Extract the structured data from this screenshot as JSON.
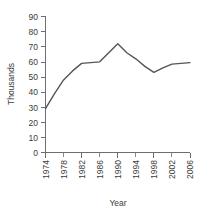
{
  "chart_data": {
    "type": "line",
    "title": "",
    "xlabel": "Year",
    "ylabel": "Thousands",
    "x": [
      1974,
      1976,
      1978,
      1980,
      1982,
      1984,
      1986,
      1988,
      1990,
      1992,
      1994,
      1996,
      1998,
      2000,
      2002,
      2004,
      2006
    ],
    "values": [
      29,
      39,
      48,
      54,
      59,
      59.5,
      60,
      66,
      72,
      66,
      62,
      57,
      53,
      56,
      58.5,
      59,
      59.5
    ],
    "series": [
      {
        "name": "Thousands",
        "color": "#55555a",
        "values": [
          29,
          39,
          48,
          54,
          59,
          59.5,
          60,
          66,
          72,
          66,
          62,
          57,
          53,
          56,
          58.5,
          59,
          59.5
        ]
      }
    ],
    "xlim": [
      1974,
      2006
    ],
    "ylim": [
      0,
      90
    ],
    "ytick_labels": [
      "0",
      "10",
      "20",
      "30",
      "40",
      "50",
      "60",
      "70",
      "80",
      "90"
    ],
    "ytick_values": [
      0,
      10,
      20,
      30,
      40,
      50,
      60,
      70,
      80,
      90
    ],
    "xtick_labels": [
      "1974",
      "1978",
      "1982",
      "1986",
      "1990",
      "1994",
      "1998",
      "2002",
      "2006"
    ],
    "xtick_values": [
      1974,
      1978,
      1982,
      1986,
      1990,
      1994,
      1998,
      2002,
      2006
    ],
    "xtick_minor_values": [
      1976,
      1980,
      1984,
      1988,
      1992,
      1996,
      2000,
      2004
    ],
    "grid": false,
    "legend": false,
    "legend_position": "none",
    "xtick_label_rotation": -90,
    "ylabel_rotation": -90,
    "background_color": "#ffffff",
    "axis_color": "#6e6e72",
    "text_color": "#3b3b3b"
  }
}
